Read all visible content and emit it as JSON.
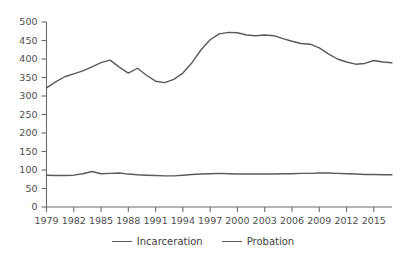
{
  "chart_data": {
    "type": "line",
    "title": "",
    "subtitle": "",
    "xlabel": "",
    "ylabel": "",
    "xlim": [
      1979,
      2017
    ],
    "ylim": [
      0,
      500
    ],
    "ytick_step": 50,
    "xtick_step": 3,
    "grid": false,
    "legend_position": "bottom",
    "yticks": [
      "0",
      "50",
      "100",
      "150",
      "200",
      "250",
      "300",
      "350",
      "400",
      "450",
      "500"
    ],
    "xticks": [
      "1979",
      "1982",
      "1985",
      "1988",
      "1991",
      "1994",
      "1997",
      "2000",
      "2003",
      "2006",
      "2009",
      "2012",
      "2015"
    ],
    "x": [
      1979,
      1980,
      1981,
      1982,
      1983,
      1984,
      1985,
      1986,
      1987,
      1988,
      1989,
      1990,
      1991,
      1992,
      1993,
      1994,
      1995,
      1996,
      1997,
      1998,
      1999,
      2000,
      2001,
      2002,
      2003,
      2004,
      2005,
      2006,
      2007,
      2008,
      2009,
      2010,
      2011,
      2012,
      2013,
      2014,
      2015,
      2016,
      2017
    ],
    "series": [
      {
        "name": "Incarceration",
        "color": "#5a5a5a",
        "values": [
          86,
          85,
          85,
          86,
          90,
          96,
          90,
          91,
          92,
          89,
          87,
          86,
          85,
          84,
          84,
          86,
          88,
          89,
          90,
          91,
          90,
          89,
          89,
          89,
          89,
          89,
          90,
          90,
          91,
          91,
          92,
          92,
          91,
          90,
          89,
          88,
          88,
          87,
          87
        ]
      },
      {
        "name": "Probation",
        "color": "#5a5a5a",
        "values": [
          322,
          338,
          352,
          360,
          368,
          379,
          390,
          397,
          378,
          362,
          375,
          356,
          340,
          336,
          345,
          362,
          390,
          425,
          452,
          468,
          472,
          471,
          465,
          463,
          465,
          463,
          455,
          448,
          442,
          440,
          430,
          414,
          400,
          392,
          386,
          388,
          396,
          392,
          390
        ]
      }
    ]
  },
  "axes": {
    "y_axis_name": "y-axis",
    "x_axis_name": "x-axis"
  },
  "legend": {
    "items": [
      {
        "label": "Incarceration",
        "color": "#5a5a5a"
      },
      {
        "label": "Probation",
        "color": "#5a5a5a"
      }
    ]
  }
}
